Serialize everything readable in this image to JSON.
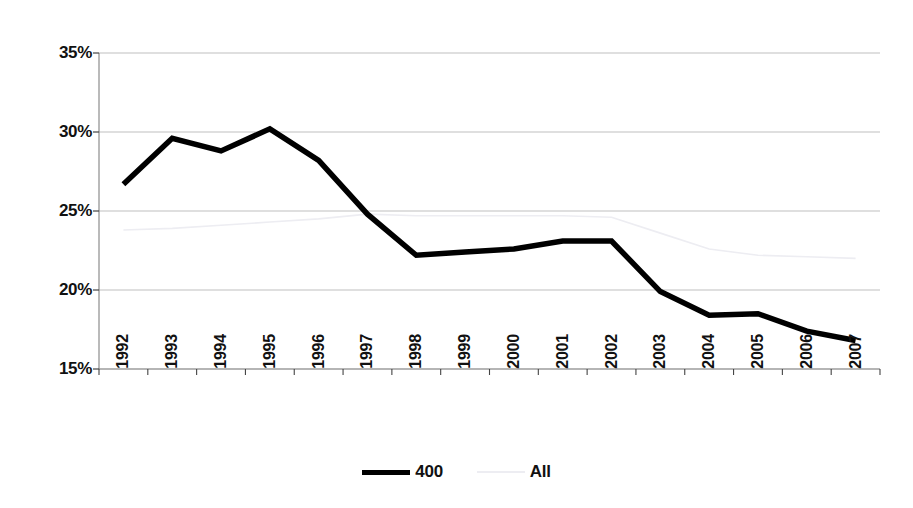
{
  "chart_data": {
    "type": "line",
    "title": "",
    "xlabel": "",
    "ylabel": "",
    "categories": [
      "1992",
      "1993",
      "1994",
      "1995",
      "1996",
      "1997",
      "1998",
      "1999",
      "2000",
      "2001",
      "2002",
      "2003",
      "2004",
      "2005",
      "2006",
      "2007"
    ],
    "series": [
      {
        "name": "400",
        "color": "#000000",
        "values": [
          26.7,
          29.6,
          28.8,
          30.2,
          28.2,
          24.8,
          22.2,
          22.4,
          22.6,
          23.1,
          23.1,
          19.9,
          18.4,
          18.5,
          17.4,
          16.8
        ]
      },
      {
        "name": "All",
        "color": "#ededf2",
        "values": [
          23.8,
          23.9,
          24.1,
          24.3,
          24.5,
          24.8,
          24.7,
          24.7,
          24.7,
          24.7,
          24.6,
          23.6,
          22.6,
          22.2,
          22.1,
          22.0
        ]
      }
    ],
    "ylim": [
      15,
      35
    ],
    "ytick_values": [
      15,
      20,
      25,
      30,
      35
    ],
    "ytick_labels": [
      "15%",
      "20%",
      "25%",
      "30%",
      "35%"
    ],
    "grid": true,
    "legend_position": "bottom",
    "y_unit": "%"
  },
  "legend": {
    "items": [
      {
        "label": "400",
        "style": "solid-thick-black"
      },
      {
        "label": "All",
        "style": "solid-thin-lightgray"
      }
    ]
  },
  "axes": {
    "y_labels": [
      "35%",
      "30%",
      "25%",
      "20%",
      "15%"
    ],
    "x_labels": [
      "1992",
      "1993",
      "1994",
      "1995",
      "1996",
      "1997",
      "1998",
      "1999",
      "2000",
      "2001",
      "2002",
      "2003",
      "2004",
      "2005",
      "2006",
      "2007"
    ]
  },
  "colors": {
    "series_400": "#000000",
    "series_all": "#ededf2",
    "gridline": "#bfbfbf",
    "axis": "#8c8c8c",
    "text": "#111111",
    "background": "#ffffff"
  }
}
